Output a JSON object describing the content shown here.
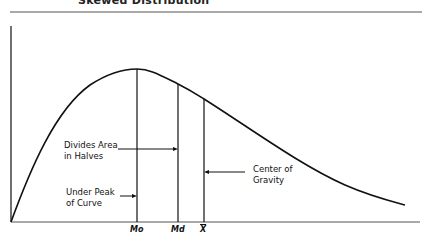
{
  "title": "Skewed Distribution",
  "annotations": {
    "divides_area": {
      "line1": "Divides Area",
      "line2": "in Halves"
    },
    "under_peak": {
      "line1": "Under Peak",
      "line2": "of Curve"
    },
    "center_gravity": {
      "line1": "Center of",
      "line2": "Gravity"
    }
  },
  "ticks": {
    "mode": "Mo",
    "median": "Md",
    "mean": "X"
  },
  "colors": {
    "stroke": "#111111",
    "rule": "#555555"
  }
}
